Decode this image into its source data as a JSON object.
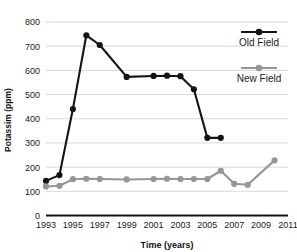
{
  "chart_data": {
    "type": "line",
    "title": "",
    "xlabel": "Time (years)",
    "ylabel": "Potassim (ppm)",
    "xlim": [
      1993,
      2011
    ],
    "ylim": [
      0,
      800
    ],
    "ytick_step": 100,
    "xtick_step": 2,
    "yticks": [
      0,
      100,
      200,
      300,
      400,
      500,
      600,
      700,
      800
    ],
    "xticks": [
      1993,
      1995,
      1997,
      1999,
      2001,
      2003,
      2005,
      2007,
      2009,
      2011
    ],
    "grid": "horizontal",
    "legend_position": "top-right",
    "series": [
      {
        "name": "Old Field",
        "color": "#141414",
        "marker": "circle",
        "x": [
          1993,
          1994,
          1995,
          1996,
          1997,
          1999,
          2001,
          2002,
          2003,
          2004,
          2005,
          2006
        ],
        "values": [
          143,
          167,
          440,
          745,
          705,
          573,
          577,
          578,
          576,
          522,
          321,
          321
        ]
      },
      {
        "name": "New Field",
        "color": "#969696",
        "marker": "circle",
        "x": [
          1993,
          1994,
          1995,
          1996,
          1997,
          1999,
          2001,
          2002,
          2003,
          2004,
          2005,
          2006,
          2007,
          2008,
          2010
        ],
        "values": [
          120,
          123,
          150,
          152,
          151,
          149,
          151,
          152,
          151,
          151,
          151,
          185,
          131,
          127,
          228
        ]
      }
    ]
  },
  "legend": {
    "items": [
      {
        "label": "Old Field",
        "color": "#141414"
      },
      {
        "label": "New Field",
        "color": "#969696"
      }
    ]
  },
  "axes": {
    "x_title": "Time (years)",
    "y_title": "Potassim (ppm)"
  }
}
